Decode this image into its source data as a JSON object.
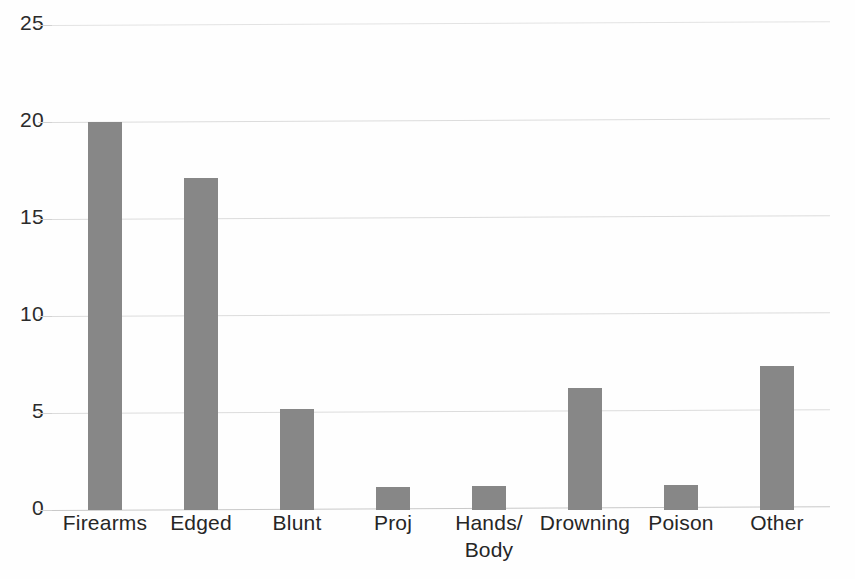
{
  "chart_data": {
    "type": "bar",
    "title": "",
    "subtitle": "",
    "xlabel": "",
    "ylabel": "",
    "categories": [
      "Firearms",
      "Edged",
      "Blunt",
      "Proj",
      "Hands/\nBody",
      "Drowning",
      "Poison",
      "Other"
    ],
    "values": [
      20,
      17.1,
      5.2,
      1.2,
      1.25,
      6.3,
      1.3,
      7.4
    ],
    "ylim": [
      0,
      25
    ],
    "yticks": [
      0,
      5,
      10,
      15,
      20,
      25
    ],
    "ytick_labels": [
      "0",
      "5",
      "10",
      "15",
      "20",
      "25"
    ],
    "grid": true,
    "legend": false,
    "legend_position": "none",
    "series": [
      {
        "name": "",
        "values": [
          20,
          17.1,
          5.2,
          1.2,
          1.25,
          6.3,
          1.3,
          7.4
        ]
      }
    ],
    "colors": {
      "bar": "#878787",
      "gridline": "#dcdcdc",
      "axis_text": "#262626",
      "background": "#fefefe"
    }
  }
}
